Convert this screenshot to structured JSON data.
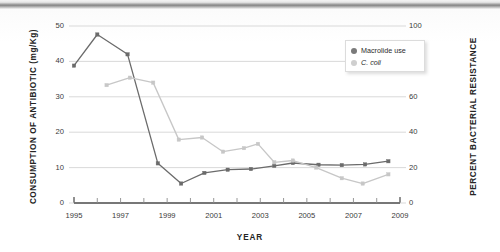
{
  "chart_data": {
    "type": "line",
    "title": "",
    "xlabel": "YEAR",
    "ylabel": "CONSUMPTION OF ANTIBIOTIC (mg/Kg)",
    "y2label": "PERCENT BACTERIAL RESISTANCE",
    "xlim": [
      1995,
      2009
    ],
    "ylim": [
      0,
      50
    ],
    "y2lim": [
      0,
      100
    ],
    "xticks": [
      1995,
      1996,
      1997,
      1998,
      1999,
      2000,
      2001,
      2002,
      2003,
      2004,
      2005,
      2006,
      2007,
      2008,
      2009
    ],
    "xtick_labels": [
      "1995",
      "",
      "1997",
      "",
      "1999",
      "",
      "2001",
      "",
      "2003",
      "",
      "2005",
      "",
      "2007",
      "",
      "2009"
    ],
    "yticks": [
      0,
      10,
      20,
      30,
      40,
      50
    ],
    "ytick_labels": [
      "0",
      "10",
      "20",
      "30",
      "40",
      "50"
    ],
    "y2ticks": [
      0,
      20,
      40,
      60,
      80,
      100
    ],
    "y2tick_labels": [
      "0",
      "20",
      "40",
      "60",
      "80",
      "100"
    ],
    "grid": true,
    "grid_axis": "y",
    "legend_position": "top-right",
    "series": [
      {
        "name": "Macrolide use",
        "axis": "left",
        "unit": "mg/Kg",
        "color": "#6b6b6b",
        "marker": "square",
        "x": [
          1995.0,
          1996.0,
          1997.3,
          1998.6,
          1999.6,
          2000.6,
          2001.6,
          2002.6,
          2003.6,
          2004.4,
          2005.5,
          2006.5,
          2007.5,
          2008.5
        ],
        "values": [
          38.8,
          47.6,
          42.0,
          11.2,
          5.5,
          8.5,
          9.4,
          9.6,
          10.5,
          11.3,
          10.8,
          10.7,
          10.9,
          11.8
        ]
      },
      {
        "name": "C. coli",
        "axis": "right",
        "unit": "%",
        "color": "#c7c7c7",
        "marker": "square",
        "x": [
          1996.4,
          1997.4,
          1998.4,
          1999.5,
          2000.5,
          2001.4,
          2002.3,
          2002.9,
          2003.6,
          2004.4,
          2005.4,
          2006.5,
          2007.4,
          2008.5
        ],
        "values": [
          66.6,
          70.8,
          68.0,
          35.8,
          37.0,
          29.0,
          31.0,
          33.4,
          23.0,
          24.0,
          20.0,
          14.0,
          11.0,
          16.2
        ]
      }
    ]
  },
  "legend": {
    "items": [
      {
        "label": "Macrolide use",
        "color": "#7a7a7a",
        "italic": false
      },
      {
        "label": "C. coli",
        "color": "#cfcfcf",
        "italic": true
      }
    ]
  },
  "axes": {
    "y_left_title": "CONSUMPTION OF ANTIBIOTIC (mg/Kg)",
    "y_right_title": "PERCENT BACTERIAL RESISTANCE",
    "x_title": "YEAR"
  },
  "colors": {
    "series_dark": "#6b6b6b",
    "series_light": "#c7c7c7",
    "gridline": "#d5d5d5",
    "axis": "#4a4a4a",
    "text": "#2b2b2b"
  }
}
